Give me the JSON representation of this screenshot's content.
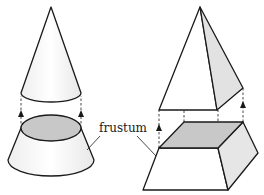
{
  "diagram": {
    "label": "frustum",
    "colors": {
      "stroke": "#1a1a1a",
      "light_fill": "#f7f7f7",
      "shade_fill": "#c8c8c8",
      "side_fill": "#e6e6e6",
      "background": "#ffffff"
    },
    "shapes": [
      {
        "name": "cone",
        "parts": [
          "top cone (removed)",
          "frustum of cone"
        ]
      },
      {
        "name": "pyramid",
        "parts": [
          "top pyramid (removed)",
          "frustum of pyramid"
        ]
      }
    ]
  }
}
